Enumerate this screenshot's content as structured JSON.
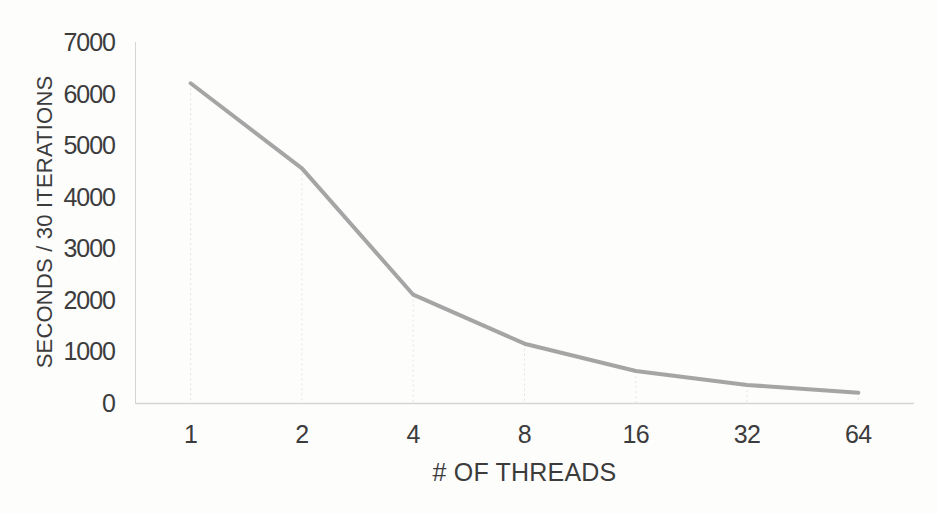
{
  "figure": {
    "background_color": "#fdfdfc",
    "text_color": "#3c3c3c"
  },
  "chart_data": {
    "type": "line",
    "title": "",
    "categories": [
      "1",
      "2",
      "4",
      "8",
      "16",
      "32",
      "64"
    ],
    "series": [
      {
        "name": "seconds-per-30-iterations",
        "values": [
          6200,
          4550,
          2100,
          1150,
          620,
          350,
          200
        ],
        "color": "#a5a5a5",
        "stroke_width": 4,
        "marker": "none"
      }
    ],
    "xlabel": "# OF THREADS",
    "ylabel": "SECONDS / 30 ITERATIONS",
    "ylim": [
      0,
      7000
    ],
    "yticks": [
      0,
      1000,
      2000,
      3000,
      4000,
      5000,
      6000,
      7000
    ],
    "x_scale_note": "categorical (powers of two)",
    "grid": "off",
    "drop_lines": true,
    "legend": "none",
    "axis_color": "#d6d6d6",
    "drop_line_color": "#e4e4e4"
  }
}
